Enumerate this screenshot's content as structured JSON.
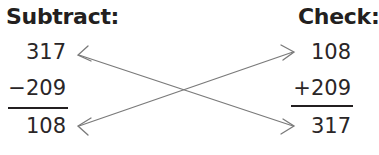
{
  "subtract": {
    "heading": "Subtract:",
    "minuend": "317",
    "subtrahend": "−209",
    "difference": "108"
  },
  "check": {
    "heading": "Check:",
    "addend1": "108",
    "addend2": "+209",
    "sum": "317"
  },
  "colors": {
    "text": "#231f20",
    "arrow": "#7a7a7a"
  }
}
